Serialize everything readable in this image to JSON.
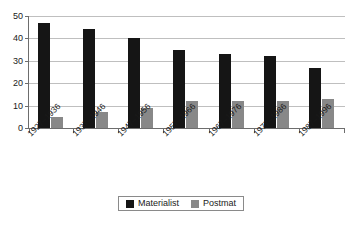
{
  "chart_data": {
    "type": "bar",
    "title": "",
    "subtitle": "",
    "xlabel": "",
    "ylabel": "",
    "categories": [
      "1927–1936",
      "1937–1946",
      "1947–1956",
      "1957–1966",
      "1967–1976",
      "1977–1986",
      "1987–1996"
    ],
    "series": [
      {
        "name": "Materialist",
        "color": "#151515",
        "values": [
          47,
          44,
          40,
          35,
          33,
          32,
          27
        ]
      },
      {
        "name": "Postmat",
        "color": "#888888",
        "values": [
          5,
          7,
          9,
          12,
          12,
          12,
          13
        ]
      }
    ],
    "ylim": [
      0,
      50
    ],
    "yticks": [
      0,
      10,
      20,
      30,
      40,
      50
    ],
    "ytick_labels": [
      "0",
      "10",
      "20",
      "30",
      "40",
      "50"
    ],
    "grid": true,
    "grid_axis": "y",
    "legend_position": "bottom",
    "annotations": []
  },
  "legend": {
    "entries": [
      {
        "label": "Materialist"
      },
      {
        "label": "Postmat"
      }
    ]
  },
  "colors": {
    "materialist": "#151515",
    "postmat": "#888888",
    "axis": "#6d6d6d",
    "grid": "#bfbfbf",
    "text": "#1a1a1a",
    "background": "#ffffff"
  }
}
